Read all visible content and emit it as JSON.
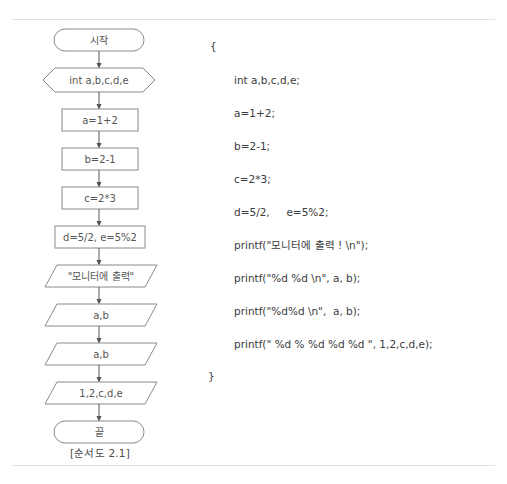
{
  "document": {
    "caption": "[순서도 2.1]"
  },
  "flowchart": {
    "title": "flowchart 2.1",
    "nodes": [
      {
        "id": "start",
        "shape": "terminator",
        "label": "시작"
      },
      {
        "id": "declare",
        "shape": "hexagon",
        "label": "int a,b,c,d,e"
      },
      {
        "id": "stmt_a",
        "shape": "process",
        "label": "a=1+2"
      },
      {
        "id": "stmt_b",
        "shape": "process",
        "label": "b=2-1"
      },
      {
        "id": "stmt_c",
        "shape": "process",
        "label": "c=2*3"
      },
      {
        "id": "stmt_de",
        "shape": "process",
        "label": "d=5/2, e=5%2"
      },
      {
        "id": "out_msg",
        "shape": "parallelogram",
        "label": "\"모니터에 출력\""
      },
      {
        "id": "out_ab1",
        "shape": "parallelogram",
        "label": "a,b"
      },
      {
        "id": "out_ab2",
        "shape": "parallelogram",
        "label": "a,b"
      },
      {
        "id": "out_all",
        "shape": "parallelogram",
        "label": "1,2,c,d,e"
      },
      {
        "id": "end",
        "shape": "terminator",
        "label": "끝"
      }
    ],
    "colors": {
      "stroke": "#8a8a8a",
      "text": "#555555",
      "arrow": "#555555"
    }
  },
  "code": {
    "lines": [
      {
        "kind": "brace",
        "text": "{"
      },
      {
        "kind": "stmt",
        "text": "int a,b,c,d,e;"
      },
      {
        "kind": "stmt",
        "text": "a=1+2;"
      },
      {
        "kind": "stmt",
        "text": "b=2-1;"
      },
      {
        "kind": "stmt",
        "text": "c=2*3;"
      },
      {
        "kind": "stmt",
        "text": "d=5/2,     e=5%2;"
      },
      {
        "kind": "stmt",
        "text": "printf(\"모니터에 출력 ! \\n\");"
      },
      {
        "kind": "stmt",
        "text": "printf(\"%d %d \\n\", a, b);"
      },
      {
        "kind": "stmt",
        "text": "printf(\"%d%d \\n\",  a, b);"
      },
      {
        "kind": "stmt",
        "text": "printf(\" %d % %d %d %d \", 1,2,c,d,e);"
      },
      {
        "kind": "close",
        "text": "}"
      }
    ]
  }
}
